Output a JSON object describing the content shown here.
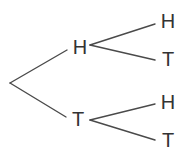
{
  "diagram": {
    "type": "probability-tree",
    "colors": {
      "line": "#4a4a4a",
      "text": "#333333",
      "background": "#ffffff"
    },
    "root": {
      "x": 10,
      "y": 83
    },
    "level1": [
      {
        "label": "H",
        "x": 80,
        "y": 47,
        "edge_end": {
          "x": 67,
          "y": 50
        },
        "branch_start": {
          "x": 90,
          "y": 45
        },
        "children": [
          {
            "label": "H",
            "x": 168,
            "y": 21,
            "edge_end": {
              "x": 155,
              "y": 24
            }
          },
          {
            "label": "T",
            "x": 168,
            "y": 59,
            "edge_end": {
              "x": 155,
              "y": 60
            }
          }
        ]
      },
      {
        "label": "T",
        "x": 78,
        "y": 119,
        "edge_end": {
          "x": 66,
          "y": 117
        },
        "branch_start": {
          "x": 90,
          "y": 120
        },
        "children": [
          {
            "label": "H",
            "x": 168,
            "y": 102,
            "edge_end": {
              "x": 155,
              "y": 104
            }
          },
          {
            "label": "T",
            "x": 168,
            "y": 140,
            "edge_end": {
              "x": 155,
              "y": 140
            }
          }
        ]
      }
    ]
  }
}
